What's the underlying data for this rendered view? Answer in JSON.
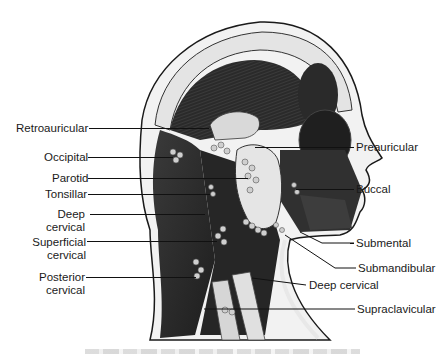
{
  "figure": {
    "labels_left": [
      {
        "id": "retroauricular",
        "text": "Retroauricular",
        "lines": [
          "Retroauricular"
        ]
      },
      {
        "id": "occipital",
        "text": "Occipital",
        "lines": [
          "Occipital"
        ]
      },
      {
        "id": "parotid",
        "text": "Parotid",
        "lines": [
          "Parotid"
        ]
      },
      {
        "id": "tonsillar",
        "text": "Tonsillar",
        "lines": [
          "Tonsillar"
        ]
      },
      {
        "id": "deep-cervical-left",
        "text": "Deep cervical",
        "lines": [
          "Deep",
          "cervical"
        ]
      },
      {
        "id": "superficial-cervical",
        "text": "Superficial cervical",
        "lines": [
          "Superficial",
          "cervical"
        ]
      },
      {
        "id": "posterior-cervical",
        "text": "Posterior cervical",
        "lines": [
          "Posterior",
          "cervical"
        ]
      }
    ],
    "labels_right": [
      {
        "id": "preauricular",
        "text": "Preauricular"
      },
      {
        "id": "buccal",
        "text": "Buccal"
      },
      {
        "id": "submental",
        "text": "Submental"
      },
      {
        "id": "submandibular",
        "text": "Submandibular"
      },
      {
        "id": "deep-cervical-right",
        "text": "Deep cervical"
      },
      {
        "id": "supraclavicular",
        "text": "Supraclavicular"
      }
    ],
    "caption": ""
  },
  "colors": {
    "background": "#ffffff",
    "skin_outline": "#1a1a1a",
    "muscle_dark": "#2b2b2b",
    "muscle_mid": "#4a4a4a",
    "skull_light": "#e6e6e6",
    "gland_light": "#dcdcdc",
    "node_fill": "#cfcfcf",
    "label_text": "#1a1a1a"
  }
}
